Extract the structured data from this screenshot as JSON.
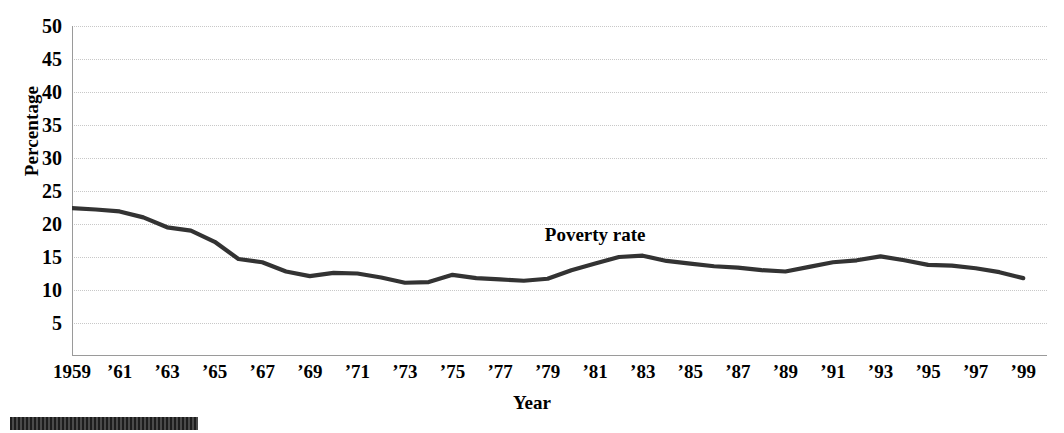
{
  "chart_data": {
    "type": "line",
    "title": "",
    "xlabel": "Year",
    "ylabel": "Percentage",
    "ylim": [
      0,
      50
    ],
    "xlim": [
      1959,
      2000
    ],
    "grid": true,
    "legend_position": "inline-annotation",
    "series": [
      {
        "name": "Poverty rate",
        "annotation": "Poverty rate",
        "annotation_year": 1981,
        "annotation_value": 18.5,
        "color": "#333333",
        "x": [
          1959,
          1960,
          1961,
          1962,
          1963,
          1964,
          1965,
          1966,
          1967,
          1968,
          1969,
          1970,
          1971,
          1972,
          1973,
          1974,
          1975,
          1976,
          1977,
          1978,
          1979,
          1980,
          1981,
          1982,
          1983,
          1984,
          1985,
          1986,
          1987,
          1988,
          1989,
          1990,
          1991,
          1992,
          1993,
          1994,
          1995,
          1996,
          1997,
          1998,
          1999
        ],
        "values": [
          22.4,
          22.2,
          21.9,
          21.0,
          19.5,
          19.0,
          17.3,
          14.7,
          14.2,
          12.8,
          12.1,
          12.6,
          12.5,
          11.9,
          11.1,
          11.2,
          12.3,
          11.8,
          11.6,
          11.4,
          11.7,
          13.0,
          14.0,
          15.0,
          15.2,
          14.4,
          14.0,
          13.6,
          13.4,
          13.0,
          12.8,
          13.5,
          14.2,
          14.5,
          15.1,
          14.5,
          13.8,
          13.7,
          13.3,
          12.7,
          11.8
        ]
      }
    ],
    "y_ticks": [
      5,
      10,
      15,
      20,
      25,
      30,
      35,
      40,
      45,
      50
    ],
    "y_tick_labels": [
      "5",
      "10",
      "15",
      "20",
      "25",
      "30",
      "35",
      "40",
      "45",
      "50"
    ],
    "x_ticks": [
      1959,
      1960,
      1961,
      1962,
      1963,
      1964,
      1965,
      1966,
      1967,
      1968,
      1969,
      1970,
      1971,
      1972,
      1973,
      1974,
      1975,
      1976,
      1977,
      1978,
      1979,
      1980,
      1981,
      1982,
      1983,
      1984,
      1985,
      1986,
      1987,
      1988,
      1989,
      1990,
      1991,
      1992,
      1993,
      1994,
      1995,
      1996,
      1997,
      1998,
      1999
    ],
    "x_tick_labels": [
      {
        "year": 1959,
        "label": "1959"
      },
      {
        "year": 1961,
        "label": "’61"
      },
      {
        "year": 1963,
        "label": "’63"
      },
      {
        "year": 1965,
        "label": "’65"
      },
      {
        "year": 1967,
        "label": "’67"
      },
      {
        "year": 1969,
        "label": "’69"
      },
      {
        "year": 1971,
        "label": "’71"
      },
      {
        "year": 1973,
        "label": "’73"
      },
      {
        "year": 1975,
        "label": "’75"
      },
      {
        "year": 1977,
        "label": "’77"
      },
      {
        "year": 1979,
        "label": "’79"
      },
      {
        "year": 1981,
        "label": "’81"
      },
      {
        "year": 1983,
        "label": "’83"
      },
      {
        "year": 1985,
        "label": "’85"
      },
      {
        "year": 1987,
        "label": "’87"
      },
      {
        "year": 1989,
        "label": "’89"
      },
      {
        "year": 1991,
        "label": "’91"
      },
      {
        "year": 1993,
        "label": "’93"
      },
      {
        "year": 1995,
        "label": "’95"
      },
      {
        "year": 1997,
        "label": "’97"
      },
      {
        "year": 1999,
        "label": "’99"
      }
    ],
    "colors": {
      "line": "#333333",
      "grid": "#c8c8c8",
      "axis": "#9a9a9a",
      "text": "#000000",
      "footer_bar": "#2b2b2b"
    }
  }
}
